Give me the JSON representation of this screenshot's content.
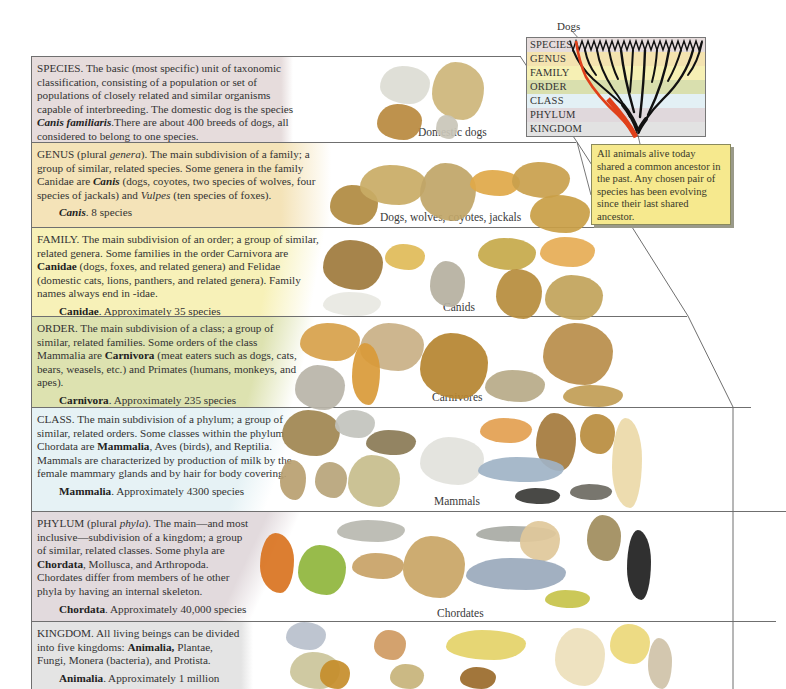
{
  "tree_diagram": {
    "pointer_label": "Dogs",
    "ranks": [
      {
        "label": "SPECIES",
        "color": "#e6dcdc"
      },
      {
        "label": "GENUS",
        "color": "#f4e3b0"
      },
      {
        "label": "FAMILY",
        "color": "#f6f0b4"
      },
      {
        "label": "ORDER",
        "color": "#d9dfae"
      },
      {
        "label": "CLASS",
        "color": "#e3f0f5"
      },
      {
        "label": "PHYLUM",
        "color": "#e0d8dc"
      },
      {
        "label": "KINGDOM",
        "color": "#e2e2e2"
      }
    ],
    "highlight_color": "#e0401a",
    "branch_color": "#111111"
  },
  "callout": {
    "text": "All animals alive today shared a common ancestor in the past. Any chosen pair of species has been evolving since their last shared ancestor."
  },
  "bands": [
    {
      "rank": "SPECIES",
      "bg": "#e6dcdc",
      "text_parts": [
        {
          "t": "SPECIES. The basic (most specific) unit of taxonomic classification, consisting of a population or set of populations of closely related and similar organisms capable of interbreeding. The domestic dog is the species "
        },
        {
          "t": "Canis familiaris",
          "style": "bi"
        },
        {
          "t": ".There are about 400 breeds of dogs, all considered to belong to one species."
        }
      ],
      "count_name": "Canis familiaris.",
      "count_name_style": "bi",
      "count_text": " 1 species",
      "caption": "Domestic dogs"
    },
    {
      "rank": "GENUS",
      "bg": "#f4e3b8",
      "text_parts": [
        {
          "t": "GENUS (plural "
        },
        {
          "t": "genera",
          "style": "i"
        },
        {
          "t": "). The main subdivision of a family; a group of similar, related species. Some genera in the family Canidae are "
        },
        {
          "t": "Canis",
          "style": "bi"
        },
        {
          "t": " (dogs, coyotes, two species of wolves, four species of jackals) and "
        },
        {
          "t": "Vulpes",
          "style": "i"
        },
        {
          "t": " (ten species of foxes)."
        }
      ],
      "count_name": "Canis",
      "count_name_style": "bi",
      "count_text": ". 8 species",
      "caption": "Dogs, wolves, coyotes, jackals"
    },
    {
      "rank": "FAMILY",
      "bg": "#f7f1b8",
      "text_parts": [
        {
          "t": "FAMILY. The main subdivision of an order; a group of similar, related genera. Some families in the order Carnivora are "
        },
        {
          "t": "Canidae",
          "style": "b"
        },
        {
          "t": " (dogs, foxes, and related genera) and Felidae (domestic cats, lions, panthers, and related genera). Family names always end in -idae."
        }
      ],
      "count_name": "Canidae",
      "count_name_style": "b",
      "count_text": ". Approximately 35 species",
      "caption": "Canids"
    },
    {
      "rank": "ORDER",
      "bg": "#dde2b0",
      "text_parts": [
        {
          "t": "ORDER. The main subdivision of a class; a group of similar, related families. Some orders of the class Mammalia are "
        },
        {
          "t": "Carnivora",
          "style": "b"
        },
        {
          "t": " (meat eaters such as dogs, cats, bears, weasels, etc.) and Primates (humans, monkeys, and apes)."
        }
      ],
      "count_name": "Carnivora",
      "count_name_style": "b",
      "count_text": ". Approximately 235 species",
      "caption": "Carnivores"
    },
    {
      "rank": "CLASS",
      "bg": "#e6f2f5",
      "text_parts": [
        {
          "t": "CLASS. The main subdivision of a phylum; a group of similar, related orders. Some classes within the phylum Chordata are "
        },
        {
          "t": "Mammalia",
          "style": "b"
        },
        {
          "t": ", Aves (birds), and Reptilia. Mammals are characterized by production of milk by the female mammary glands and by hair for body covering."
        }
      ],
      "count_name": "Mammalia",
      "count_name_style": "b",
      "count_text": ". Approximately 4300 species",
      "caption": "Mammals"
    },
    {
      "rank": "PHYLUM",
      "bg": "#e2dadd",
      "text_parts": [
        {
          "t": "PHYLUM (plural "
        },
        {
          "t": "phyla",
          "style": "i"
        },
        {
          "t": "). The main—and most inclusive—subdivision of a kingdom; a group of similar, related classes. Some phyla are "
        },
        {
          "t": "Chordata",
          "style": "b"
        },
        {
          "t": ", Mollusca, and Arthropoda. Chordates differ from members of he other  phyla by having an internal skeleton."
        }
      ],
      "count_name": "Chordata",
      "count_name_style": "b",
      "count_text": ". Approximately 40,000 species",
      "caption": "Chordates"
    },
    {
      "rank": "KINGDOM",
      "bg": "#e4e4e4",
      "text_parts": [
        {
          "t": "KINGDOM. All living beings can be divided into five kingdoms: "
        },
        {
          "t": "Animalia,",
          "style": "b"
        },
        {
          "t": " Plantae, Fungi, Monera (bacteria), and Protista."
        }
      ],
      "count_name": "Animalia",
      "count_name_style": "b",
      "count_text": ". Approximately 1 million",
      "caption": ""
    }
  ]
}
